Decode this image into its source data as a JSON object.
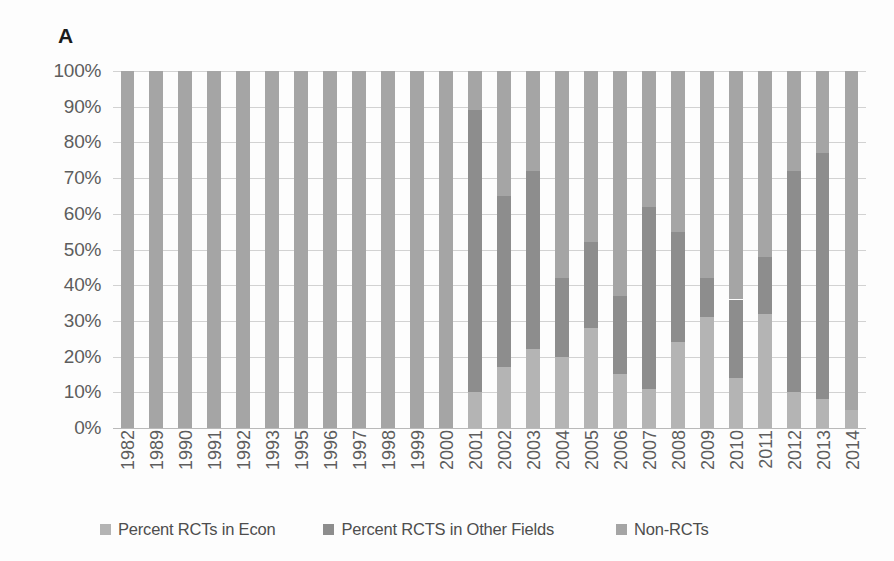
{
  "figure": {
    "panel_label": "A"
  },
  "legend": {
    "position": "bottom",
    "items": [
      {
        "label": "Percent RCTs in Econ",
        "color": "#b4b4b4",
        "swatch": "legend-swatch-econ"
      },
      {
        "label": "Percent RCTS in Other Fields",
        "color": "#8d8d8d",
        "swatch": "legend-swatch-other"
      },
      {
        "label": "Non-RCTs",
        "color": "#a5a5a5",
        "swatch": "legend-swatch-non"
      }
    ]
  },
  "axes": {
    "y_ticks": [
      "100%",
      "90%",
      "80%",
      "70%",
      "60%",
      "50%",
      "40%",
      "30%",
      "20%",
      "10%",
      "0%"
    ],
    "y_values": [
      100,
      90,
      80,
      70,
      60,
      50,
      40,
      30,
      20,
      10,
      0
    ]
  },
  "chart_data": {
    "type": "bar",
    "subtype": "stacked-100-percent",
    "title": "",
    "panel_label": "A",
    "xlabel": "",
    "ylabel": "",
    "ylim": [
      0,
      100
    ],
    "ytick_format": "percent",
    "grid": "horizontal",
    "legend_position": "bottom",
    "stack_order_bottom_to_top": [
      "Percent RCTs in Econ",
      "Percent RCTS in Other Fields",
      "Non-RCTs"
    ],
    "categories": [
      "1982",
      "1989",
      "1990",
      "1991",
      "1992",
      "1993",
      "1995",
      "1996",
      "1997",
      "1998",
      "1999",
      "2000",
      "2001",
      "2002",
      "2003",
      "2004",
      "2005",
      "2006",
      "2007",
      "2008",
      "2009",
      "2010",
      "2011",
      "2012",
      "2013",
      "2014"
    ],
    "series": [
      {
        "name": "Percent RCTs in Econ",
        "color": "#b4b4b4",
        "values": [
          0,
          0,
          0,
          0,
          0,
          0,
          0,
          0,
          0,
          0,
          0,
          0,
          10,
          17,
          22,
          20,
          28,
          15,
          11,
          24,
          31,
          14,
          32,
          10,
          8,
          5
        ]
      },
      {
        "name": "Percent RCTS in Other Fields",
        "color": "#8d8d8d",
        "values": [
          0,
          0,
          0,
          0,
          0,
          0,
          0,
          0,
          0,
          0,
          0,
          0,
          79,
          48,
          50,
          22,
          24,
          22,
          51,
          31,
          11,
          22,
          16,
          62,
          69,
          0
        ]
      },
      {
        "name": "Non-RCTs",
        "color": "#a5a5a5",
        "values": [
          100,
          100,
          100,
          100,
          100,
          100,
          100,
          100,
          100,
          100,
          100,
          100,
          11,
          35,
          28,
          58,
          48,
          63,
          38,
          45,
          58,
          64,
          52,
          28,
          23,
          95
        ]
      }
    ]
  }
}
